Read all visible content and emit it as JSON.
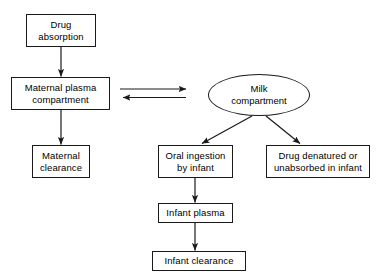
{
  "diagram": {
    "type": "flowchart",
    "background_color": "#ffffff",
    "stroke_color": "#1a1a1a",
    "text_color": "#000000",
    "nodes": [
      {
        "id": "drug-absorption",
        "label": "Drug\nabsorption",
        "shape": "rect"
      },
      {
        "id": "maternal-plasma",
        "label": "Maternal plasma\ncompartment",
        "shape": "rect"
      },
      {
        "id": "maternal-clearance",
        "label": "Maternal\nclearance",
        "shape": "rect"
      },
      {
        "id": "milk-compartment",
        "label": "Milk\ncompartment",
        "shape": "ellipse"
      },
      {
        "id": "oral-ingestion",
        "label": "Oral ingestion\nby infant",
        "shape": "rect"
      },
      {
        "id": "drug-denatured",
        "label": "Drug denatured or\nunabsorbed in infant",
        "shape": "rect"
      },
      {
        "id": "infant-plasma",
        "label": "Infant plasma",
        "shape": "rect"
      },
      {
        "id": "infant-clearance",
        "label": "Infant clearance",
        "shape": "rect"
      }
    ],
    "edges": [
      {
        "id": "edge-absorption-to-maternal-plasma",
        "from": "drug-absorption",
        "to": "maternal-plasma",
        "direction": "down"
      },
      {
        "id": "edge-maternal-plasma-to-clearance",
        "from": "maternal-plasma",
        "to": "maternal-clearance",
        "direction": "down"
      },
      {
        "id": "edge-maternal-plasma-to-milk",
        "from": "maternal-plasma",
        "to": "milk-compartment",
        "direction": "right"
      },
      {
        "id": "edge-milk-to-maternal-plasma",
        "from": "milk-compartment",
        "to": "maternal-plasma",
        "direction": "left"
      },
      {
        "id": "edge-milk-to-oral-ingestion",
        "from": "milk-compartment",
        "to": "oral-ingestion",
        "direction": "down-left"
      },
      {
        "id": "edge-milk-to-drug-denatured",
        "from": "milk-compartment",
        "to": "drug-denatured",
        "direction": "down-right"
      },
      {
        "id": "edge-oral-ingestion-to-infant-plasma",
        "from": "oral-ingestion",
        "to": "infant-plasma",
        "direction": "down"
      },
      {
        "id": "edge-infant-plasma-to-clearance",
        "from": "infant-plasma",
        "to": "infant-clearance",
        "direction": "down"
      }
    ]
  }
}
